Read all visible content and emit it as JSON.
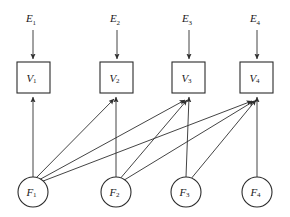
{
  "diagram": {
    "type": "directed-graph",
    "background_color": "#ffffff",
    "line_color": "#2f2f2f",
    "node_stroke_color": "#2b2b2b",
    "node_fill_color": "#ffffff",
    "external_nodes": [
      {
        "id": "E1",
        "base": "E",
        "subscript": "1",
        "label": "E₁",
        "x": 33,
        "y": 22
      },
      {
        "id": "E2",
        "base": "E",
        "subscript": "2",
        "label": "E₂",
        "x": 117,
        "y": 22
      },
      {
        "id": "E3",
        "base": "E",
        "subscript": "3",
        "label": "E₃",
        "x": 189,
        "y": 22
      },
      {
        "id": "E4",
        "base": "E",
        "subscript": "4",
        "label": "E₄",
        "x": 257,
        "y": 22
      }
    ],
    "variable_nodes": [
      {
        "id": "V1",
        "base": "V",
        "subscript": "1",
        "label": "V₁",
        "shape": "rect",
        "x": 17,
        "y": 62,
        "w": 33,
        "h": 31
      },
      {
        "id": "V2",
        "base": "V",
        "subscript": "2",
        "label": "V₂",
        "shape": "rect",
        "x": 100,
        "y": 62,
        "w": 33,
        "h": 31
      },
      {
        "id": "V3",
        "base": "V",
        "subscript": "3",
        "label": "V₃",
        "shape": "rect",
        "x": 172,
        "y": 62,
        "w": 33,
        "h": 31
      },
      {
        "id": "V4",
        "base": "V",
        "subscript": "4",
        "label": "V₄",
        "shape": "rect",
        "x": 240,
        "y": 62,
        "w": 33,
        "h": 31
      }
    ],
    "factor_nodes": [
      {
        "id": "F1",
        "base": "F",
        "subscript": "1",
        "label": "F₁",
        "shape": "circle",
        "cx": 33,
        "cy": 192,
        "r": 15
      },
      {
        "id": "F2",
        "base": "F",
        "subscript": "2",
        "label": "F₂",
        "shape": "circle",
        "cx": 116,
        "cy": 192,
        "r": 15
      },
      {
        "id": "F3",
        "base": "F",
        "subscript": "3",
        "label": "F₃",
        "shape": "circle",
        "cx": 186,
        "cy": 192,
        "r": 15
      },
      {
        "id": "F4",
        "base": "F",
        "subscript": "4",
        "label": "F₄",
        "shape": "circle",
        "cx": 257,
        "cy": 192,
        "r": 15
      }
    ],
    "external_edges": [
      {
        "from": "E1",
        "to": "V1",
        "x1": 33,
        "y1": 30,
        "x2": 33,
        "y2": 60
      },
      {
        "from": "E2",
        "to": "V2",
        "x1": 117,
        "y1": 30,
        "x2": 117,
        "y2": 60
      },
      {
        "from": "E3",
        "to": "V3",
        "x1": 189,
        "y1": 30,
        "x2": 189,
        "y2": 60
      },
      {
        "from": "E4",
        "to": "V4",
        "x1": 257,
        "y1": 30,
        "x2": 257,
        "y2": 60
      }
    ],
    "factor_edges": [
      {
        "from": "F1",
        "to": "V1",
        "x1": 33,
        "y1": 177,
        "x2": 33,
        "y2": 96
      },
      {
        "from": "F1",
        "to": "V2",
        "x1": 36,
        "y1": 178,
        "x2": 116,
        "y2": 97
      },
      {
        "from": "F1",
        "to": "V3",
        "x1": 38,
        "y1": 180,
        "x2": 188,
        "y2": 98
      },
      {
        "from": "F1",
        "to": "V4",
        "x1": 39,
        "y1": 182,
        "x2": 258,
        "y2": 99
      },
      {
        "from": "F2",
        "to": "V2",
        "x1": 116,
        "y1": 177,
        "x2": 116,
        "y2": 96
      },
      {
        "from": "F2",
        "to": "V3",
        "x1": 120,
        "y1": 179,
        "x2": 190,
        "y2": 97
      },
      {
        "from": "F2",
        "to": "V4",
        "x1": 122,
        "y1": 181,
        "x2": 259,
        "y2": 99
      },
      {
        "from": "F3",
        "to": "V3",
        "x1": 186,
        "y1": 177,
        "x2": 189,
        "y2": 96
      },
      {
        "from": "F3",
        "to": "V4",
        "x1": 190,
        "y1": 179,
        "x2": 260,
        "y2": 98
      },
      {
        "from": "F4",
        "to": "V4",
        "x1": 257,
        "y1": 177,
        "x2": 257,
        "y2": 96
      }
    ],
    "adjacency_summary": [
      {
        "factor": "F1",
        "variables": [
          "V1",
          "V2",
          "V3",
          "V4"
        ]
      },
      {
        "factor": "F2",
        "variables": [
          "V2",
          "V3",
          "V4"
        ]
      },
      {
        "factor": "F3",
        "variables": [
          "V3",
          "V4"
        ]
      },
      {
        "factor": "F4",
        "variables": [
          "V4"
        ]
      }
    ]
  }
}
